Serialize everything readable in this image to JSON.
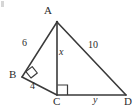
{
  "figure": {
    "type": "geometry-diagram",
    "stroke_color": "#3a3a3a",
    "text_color": "#2b2b2b",
    "background_color": "#ffffff",
    "points": {
      "A": {
        "label": "A",
        "x": 57,
        "y": 22,
        "label_x": 44,
        "label_y": 5
      },
      "B": {
        "label": "B",
        "x": 22,
        "y": 77,
        "label_x": 9,
        "label_y": 69
      },
      "C": {
        "label": "C",
        "x": 57,
        "y": 95,
        "label_x": 53,
        "label_y": 96
      },
      "D": {
        "label": "D",
        "x": 126,
        "y": 95,
        "label_x": 124,
        "label_y": 96
      }
    },
    "segments": [
      {
        "name": "AB",
        "from": "A",
        "to": "B",
        "length_label": "6"
      },
      {
        "name": "BC",
        "from": "B",
        "to": "C",
        "length_label": "4"
      },
      {
        "name": "AC",
        "from": "A",
        "to": "C",
        "length_label": "x"
      },
      {
        "name": "AD",
        "from": "A",
        "to": "D",
        "length_label": "10"
      },
      {
        "name": "CD",
        "from": "C",
        "to": "D",
        "length_label": "y"
      }
    ],
    "measure_labels": [
      {
        "name": "segment-label-ab",
        "text": "6",
        "x": 22,
        "y": 38,
        "style": "length"
      },
      {
        "name": "segment-label-bc",
        "text": "4",
        "x": 30,
        "y": 81,
        "style": "length"
      },
      {
        "name": "segment-label-ac",
        "text": "x",
        "x": 59,
        "y": 47,
        "style": "var"
      },
      {
        "name": "segment-label-ad",
        "text": "10",
        "x": 88,
        "y": 40,
        "style": "length"
      },
      {
        "name": "segment-label-cd",
        "text": "y",
        "x": 93,
        "y": 95,
        "style": "var"
      }
    ],
    "right_angles": [
      {
        "name": "right-angle-b",
        "at": "B",
        "rotated": true
      },
      {
        "name": "right-angle-c",
        "at": "C",
        "rotated": false
      }
    ]
  }
}
